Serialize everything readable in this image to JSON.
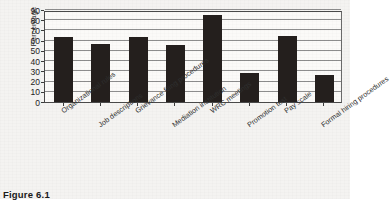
{
  "caption": "Figure 6.1",
  "chart_data": {
    "type": "bar",
    "title": "",
    "xlabel": "",
    "ylabel": "Percentage",
    "ylim": [
      0,
      90
    ],
    "ytick_step": 10,
    "yticks": [
      0,
      10,
      20,
      30,
      40,
      50,
      60,
      70,
      80,
      90
    ],
    "grid": true,
    "legend": "none",
    "bar_color": "#241f1d",
    "categories": [
      "Organizational rules",
      "Job descriptions",
      "Grievance filing procedures",
      "Mediation institution",
      "WRC meetings",
      "Promotion test",
      "Pay scale",
      "Formal hiring procedures"
    ],
    "values": [
      64,
      57,
      64,
      56,
      85,
      28,
      65,
      26
    ]
  }
}
